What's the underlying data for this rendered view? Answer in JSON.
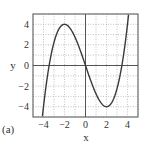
{
  "chart_data": {
    "type": "line",
    "title": "",
    "panel_label": "(a)",
    "xlabel": "x",
    "ylabel": "y",
    "xlim": [
      -5,
      5
    ],
    "ylim": [
      -5,
      5
    ],
    "xticks": [
      -4,
      -2,
      0,
      2,
      4
    ],
    "yticks": [
      -4,
      -2,
      0,
      2,
      4
    ],
    "xtick_labels": [
      "−4",
      "−2",
      "0",
      "2",
      "4"
    ],
    "ytick_labels": [
      "4",
      "2",
      "0",
      "−2",
      "−4"
    ],
    "grid": "dotted, every 1 unit",
    "legend": null,
    "series": [
      {
        "name": "y = x^3/4 - 3x",
        "color": "#444444",
        "x": [
          -3.85,
          -3.5,
          -3,
          -2.5,
          -2,
          -1.5,
          -1,
          -0.5,
          0,
          0.5,
          1,
          1.5,
          2,
          2.5,
          3,
          3.5,
          4,
          4.1
        ],
        "y": [
          -2.72,
          0.78,
          2.25,
          3.59,
          4,
          3.66,
          2.75,
          1.47,
          0,
          -1.47,
          -2.75,
          -3.66,
          -4,
          -3.59,
          -2.25,
          0.22,
          4,
          4.93
        ]
      }
    ],
    "annotations": [
      {
        "text": "local max",
        "x": -2,
        "y": 4
      },
      {
        "text": "local min",
        "x": 2,
        "y": -4
      }
    ]
  }
}
